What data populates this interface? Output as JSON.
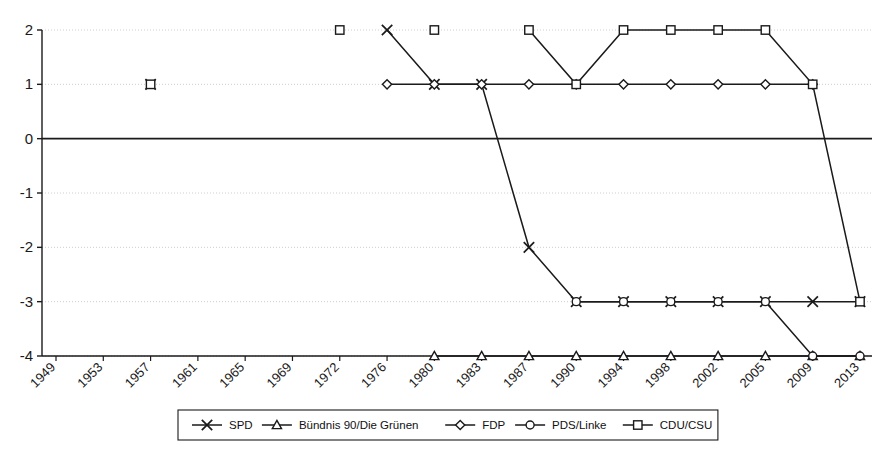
{
  "chart_data": {
    "type": "line",
    "title": "",
    "xlabel": "",
    "ylabel": "",
    "grid": true,
    "legend_position": "bottom",
    "ylim": [
      -4,
      2
    ],
    "yticks": [
      2,
      1,
      0,
      -1,
      -2,
      -3,
      -4
    ],
    "ytick_labels": [
      "2",
      "1",
      "0",
      "-1",
      "-2",
      "-3",
      "-4"
    ],
    "categories": [
      "1949",
      "1953",
      "1957",
      "1961",
      "1965",
      "1969",
      "1972",
      "1976",
      "1980",
      "1983",
      "1987",
      "1990",
      "1994",
      "1998",
      "2002",
      "2005",
      "2009",
      "2013"
    ],
    "series": [
      {
        "name": "SPD",
        "marker": "x",
        "points": [
          {
            "x": "1957",
            "y": 1
          },
          {
            "x": "1976",
            "y": 2
          },
          {
            "x": "1980",
            "y": 1
          },
          {
            "x": "1983",
            "y": 1
          },
          {
            "x": "1987",
            "y": -2
          },
          {
            "x": "1990",
            "y": -3
          },
          {
            "x": "1994",
            "y": -3
          },
          {
            "x": "1998",
            "y": -3
          },
          {
            "x": "2002",
            "y": -3
          },
          {
            "x": "2005",
            "y": -3
          },
          {
            "x": "2009",
            "y": -3
          },
          {
            "x": "2013",
            "y": -3
          }
        ],
        "segments": [
          [
            "1976",
            "1980",
            "1983",
            "1987",
            "1990",
            "1994",
            "1998",
            "2002",
            "2005",
            "2009",
            "2013"
          ]
        ]
      },
      {
        "name": "Bündnis 90/Die Grünen",
        "marker": "triangle",
        "points": [
          {
            "x": "1980",
            "y": -4
          },
          {
            "x": "1983",
            "y": -4
          },
          {
            "x": "1987",
            "y": -4
          },
          {
            "x": "1990",
            "y": -4
          },
          {
            "x": "1994",
            "y": -4
          },
          {
            "x": "1998",
            "y": -4
          },
          {
            "x": "2002",
            "y": -4
          },
          {
            "x": "2005",
            "y": -4
          },
          {
            "x": "2009",
            "y": -4
          },
          {
            "x": "2013",
            "y": -4
          }
        ],
        "segments": [
          [
            "1980",
            "1983",
            "1987",
            "1990",
            "1994",
            "1998",
            "2002",
            "2005",
            "2009",
            "2013"
          ]
        ]
      },
      {
        "name": "FDP",
        "marker": "diamond",
        "points": [
          {
            "x": "1976",
            "y": 1
          },
          {
            "x": "1980",
            "y": 1
          },
          {
            "x": "1983",
            "y": 1
          },
          {
            "x": "1987",
            "y": 1
          },
          {
            "x": "1990",
            "y": 1
          },
          {
            "x": "1994",
            "y": 1
          },
          {
            "x": "1998",
            "y": 1
          },
          {
            "x": "2002",
            "y": 1
          },
          {
            "x": "2005",
            "y": 1
          },
          {
            "x": "2009",
            "y": 1
          }
        ],
        "segments": [
          [
            "1976",
            "1980",
            "1983",
            "1987",
            "1990",
            "1994",
            "1998",
            "2002",
            "2005",
            "2009"
          ]
        ]
      },
      {
        "name": "PDS/Linke",
        "marker": "circle",
        "points": [
          {
            "x": "1990",
            "y": -3
          },
          {
            "x": "1994",
            "y": -3
          },
          {
            "x": "1998",
            "y": -3
          },
          {
            "x": "2002",
            "y": -3
          },
          {
            "x": "2005",
            "y": -3
          },
          {
            "x": "2009",
            "y": -4
          },
          {
            "x": "2013",
            "y": -4
          }
        ],
        "segments": [
          [
            "1990",
            "1994",
            "1998",
            "2002",
            "2005",
            "2009",
            "2013"
          ]
        ]
      },
      {
        "name": "CDU/CSU",
        "marker": "square",
        "points": [
          {
            "x": "1957",
            "y": 1
          },
          {
            "x": "1972",
            "y": 2
          },
          {
            "x": "1980",
            "y": 2
          },
          {
            "x": "1987",
            "y": 2
          },
          {
            "x": "1990",
            "y": 1
          },
          {
            "x": "1994",
            "y": 2
          },
          {
            "x": "1998",
            "y": 2
          },
          {
            "x": "2002",
            "y": 2
          },
          {
            "x": "2005",
            "y": 2
          },
          {
            "x": "2009",
            "y": 1
          },
          {
            "x": "2013",
            "y": -3
          }
        ],
        "segments": [
          [
            "1987",
            "1990",
            "1994",
            "1998",
            "2002",
            "2005",
            "2009",
            "2013"
          ]
        ]
      }
    ]
  },
  "legend": {
    "entries": [
      {
        "label": "SPD",
        "marker": "x"
      },
      {
        "label": "Bündnis 90/Die Grünen",
        "marker": "triangle"
      },
      {
        "label": "FDP",
        "marker": "diamond"
      },
      {
        "label": "PDS/Linke",
        "marker": "circle"
      },
      {
        "label": "CDU/CSU",
        "marker": "square"
      }
    ]
  },
  "colors": {
    "line": "#1a1a1a",
    "grid": "#c8c8c8",
    "axis": "#1a1a1a",
    "background": "#ffffff",
    "marker_fill": "#ffffff"
  }
}
